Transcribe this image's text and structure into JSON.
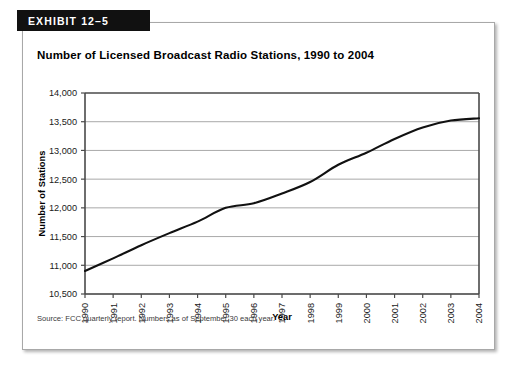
{
  "exhibit": {
    "banner_label": "EXHIBIT 12–5",
    "title": "Number of Licensed Broadcast Radio Stations, 1990 to 2004",
    "source_note": "Source: FCC quarterly report. Numbers as of September 30 each year."
  },
  "chart_data": {
    "type": "line",
    "title": "Number of Licensed Broadcast Radio Stations, 1990 to 2004",
    "xlabel": "Year",
    "ylabel": "Number of Stations",
    "categories": [
      "1990",
      "1991",
      "1992",
      "1993",
      "1994",
      "1995",
      "1996",
      "1997",
      "1998",
      "1999",
      "2000",
      "2001",
      "2002",
      "2003",
      "2004"
    ],
    "values": [
      10900,
      11120,
      11350,
      11560,
      11760,
      12000,
      12080,
      12250,
      12450,
      12750,
      12960,
      13200,
      13400,
      13520,
      13560
    ],
    "ylim": [
      10500,
      14000
    ],
    "ytick_labels": [
      "10,500",
      "11,000",
      "11,500",
      "12,000",
      "12,500",
      "13,000",
      "13,500",
      "14,000"
    ],
    "ytick_values": [
      10500,
      11000,
      11500,
      12000,
      12500,
      13000,
      13500,
      14000
    ],
    "grid": true,
    "legend": "none",
    "line_color": "#111111",
    "grid_color": "#a9a9a9",
    "axis_color": "#4a4a4a"
  }
}
